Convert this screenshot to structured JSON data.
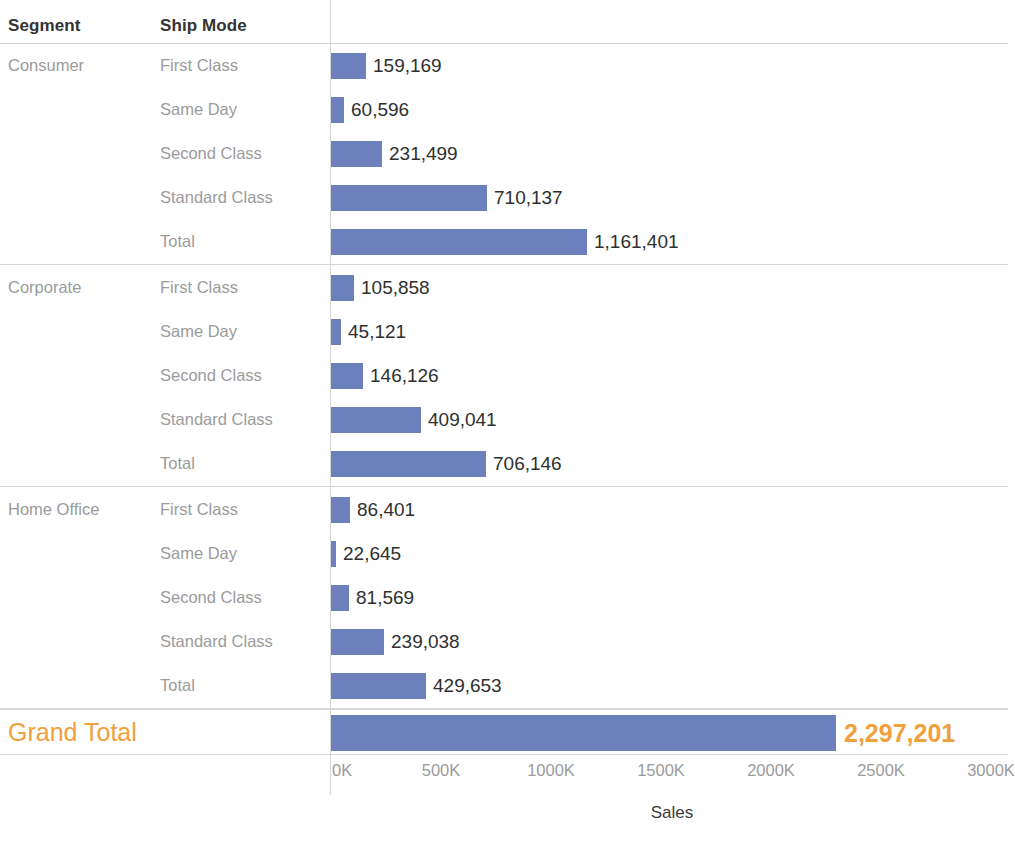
{
  "header": {
    "segment_label": "Segment",
    "shipmode_label": "Ship Mode"
  },
  "axis": {
    "title": "Sales",
    "ticks": [
      "0K",
      "500K",
      "1000K",
      "1500K",
      "2000K",
      "2500K",
      "3000K"
    ],
    "tick_values": [
      0,
      500000,
      1000000,
      1500000,
      2000000,
      2500000,
      3000000
    ],
    "min": 0,
    "max": 3000000
  },
  "grand_total": {
    "label": "Grand Total",
    "value_label": "2,297,201",
    "value": 2297201
  },
  "colors": {
    "bar": "#6b80bd",
    "grand_total_text": "#f0a03c",
    "value_text": "#2f2f2f",
    "row_text": "#9b9b9b",
    "rule": "#d6d6d6"
  },
  "chart_data": {
    "type": "bar",
    "title": "",
    "xlabel": "Sales",
    "ylabel": "",
    "orientation": "horizontal",
    "xlim": [
      0,
      3000000
    ],
    "grid": false,
    "legend": "none",
    "xticks": [
      0,
      500000,
      1000000,
      1500000,
      2000000,
      2500000,
      3000000
    ],
    "xticklabels": [
      "0K",
      "500K",
      "1000K",
      "1500K",
      "2000K",
      "2500K",
      "3000K"
    ],
    "groups": [
      {
        "segment": "Consumer",
        "rows": [
          {
            "ship_mode": "First Class",
            "value": 159169,
            "label": "159,169"
          },
          {
            "ship_mode": "Same Day",
            "value": 60596,
            "label": "60,596"
          },
          {
            "ship_mode": "Second Class",
            "value": 231499,
            "label": "231,499"
          },
          {
            "ship_mode": "Standard Class",
            "value": 710137,
            "label": "710,137"
          },
          {
            "ship_mode": "Total",
            "value": 1161401,
            "label": "1,161,401"
          }
        ]
      },
      {
        "segment": "Corporate",
        "rows": [
          {
            "ship_mode": "First Class",
            "value": 105858,
            "label": "105,858"
          },
          {
            "ship_mode": "Same Day",
            "value": 45121,
            "label": "45,121"
          },
          {
            "ship_mode": "Second Class",
            "value": 146126,
            "label": "146,126"
          },
          {
            "ship_mode": "Standard Class",
            "value": 409041,
            "label": "409,041"
          },
          {
            "ship_mode": "Total",
            "value": 706146,
            "label": "706,146"
          }
        ]
      },
      {
        "segment": "Home Office",
        "rows": [
          {
            "ship_mode": "First Class",
            "value": 86401,
            "label": "86,401"
          },
          {
            "ship_mode": "Same Day",
            "value": 22645,
            "label": "22,645"
          },
          {
            "ship_mode": "Second Class",
            "value": 81569,
            "label": "81,569"
          },
          {
            "ship_mode": "Standard Class",
            "value": 239038,
            "label": "239,038"
          },
          {
            "ship_mode": "Total",
            "value": 429653,
            "label": "429,653"
          }
        ]
      }
    ],
    "grand_total": {
      "label": "Grand Total",
      "value": 2297201,
      "value_label": "2,297,201"
    }
  }
}
